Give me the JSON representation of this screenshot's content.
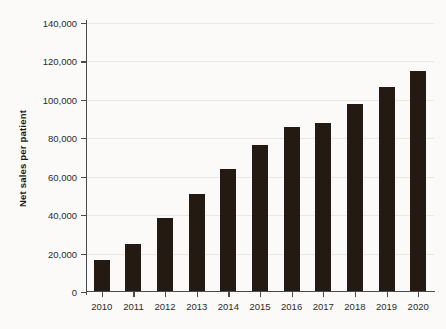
{
  "chart_data": {
    "type": "bar",
    "title": "",
    "subtitle": "",
    "xlabel": "",
    "ylabel": "Net sales per patient",
    "categories": [
      "2010",
      "2011",
      "2012",
      "2013",
      "2014",
      "2015",
      "2016",
      "2017",
      "2018",
      "2019",
      "2020"
    ],
    "values": [
      16100,
      24300,
      37600,
      50400,
      63200,
      75700,
      85300,
      87100,
      97200,
      106200,
      114200
    ],
    "series": [
      {
        "name": "Net sales per patient",
        "values": [
          16100,
          24300,
          37600,
          50400,
          63200,
          75700,
          85300,
          87100,
          97200,
          106200,
          114200
        ]
      }
    ],
    "ylim": [
      0,
      140000
    ],
    "yticks": [
      0,
      20000,
      40000,
      60000,
      80000,
      100000,
      120000,
      140000
    ],
    "ytick_labels": [
      "0",
      "20,000",
      "40,000",
      "60,000",
      "80,000",
      "100,000",
      "120,000",
      "140,000"
    ],
    "xtick_labels": [
      "2010",
      "2011",
      "2012",
      "2013",
      "2014",
      "2015",
      "2016",
      "2017",
      "2018",
      "2019",
      "2020"
    ],
    "grid": true,
    "grid_axis": "y",
    "legend": false,
    "legend_position": "none",
    "bar_color": "#241a14",
    "gridline_color": "#e9e7e3",
    "axis_color": "#4a4a4a",
    "background_color": "#fbfaf8",
    "text_color": "#2b2b2b"
  }
}
